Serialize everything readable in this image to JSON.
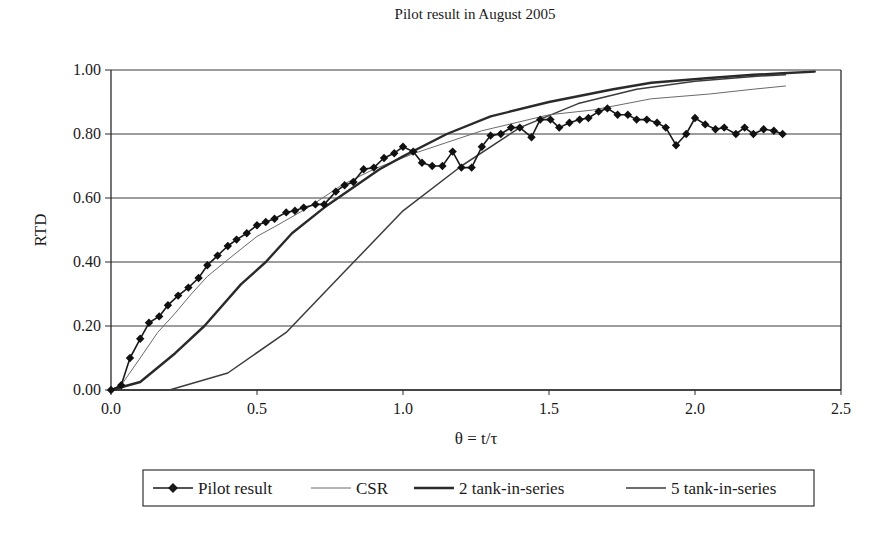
{
  "chart_data": {
    "type": "line",
    "title": "Pilot result in August 2005",
    "xlabel": "θ = t/τ",
    "ylabel": "RTD",
    "xlim": [
      0,
      2.5
    ],
    "ylim": [
      0,
      1.0
    ],
    "x_ticks": [
      "0.0",
      "0.5",
      "1.0",
      "1.5",
      "2.0",
      "2.5"
    ],
    "x_tick_values": [
      0,
      0.5,
      1.0,
      1.5,
      2.0,
      2.5
    ],
    "y_ticks": [
      "0.00",
      "0.20",
      "0.40",
      "0.60",
      "0.80",
      "1.00"
    ],
    "y_tick_values": [
      0,
      0.2,
      0.4,
      0.6,
      0.8,
      1.0
    ],
    "grid": {
      "horizontal": true,
      "vertical": false
    },
    "legend_position": "bottom",
    "series": [
      {
        "name": "Pilot result",
        "style": "line-with-diamond-markers",
        "color": "#1a1a1a",
        "points": [
          [
            0.0,
            0.0
          ],
          [
            0.035,
            0.015
          ],
          [
            0.065,
            0.1
          ],
          [
            0.1,
            0.16
          ],
          [
            0.13,
            0.21
          ],
          [
            0.165,
            0.23
          ],
          [
            0.195,
            0.265
          ],
          [
            0.23,
            0.295
          ],
          [
            0.265,
            0.32
          ],
          [
            0.3,
            0.35
          ],
          [
            0.33,
            0.39
          ],
          [
            0.365,
            0.42
          ],
          [
            0.4,
            0.45
          ],
          [
            0.43,
            0.47
          ],
          [
            0.465,
            0.49
          ],
          [
            0.5,
            0.515
          ],
          [
            0.53,
            0.525
          ],
          [
            0.56,
            0.535
          ],
          [
            0.6,
            0.555
          ],
          [
            0.63,
            0.56
          ],
          [
            0.66,
            0.57
          ],
          [
            0.7,
            0.58
          ],
          [
            0.73,
            0.58
          ],
          [
            0.77,
            0.62
          ],
          [
            0.8,
            0.64
          ],
          [
            0.83,
            0.65
          ],
          [
            0.865,
            0.69
          ],
          [
            0.9,
            0.695
          ],
          [
            0.935,
            0.725
          ],
          [
            0.97,
            0.74
          ],
          [
            1.0,
            0.76
          ],
          [
            1.035,
            0.745
          ],
          [
            1.065,
            0.71
          ],
          [
            1.1,
            0.7
          ],
          [
            1.135,
            0.7
          ],
          [
            1.17,
            0.745
          ],
          [
            1.2,
            0.695
          ],
          [
            1.235,
            0.695
          ],
          [
            1.27,
            0.76
          ],
          [
            1.3,
            0.795
          ],
          [
            1.335,
            0.8
          ],
          [
            1.37,
            0.82
          ],
          [
            1.4,
            0.82
          ],
          [
            1.44,
            0.79
          ],
          [
            1.47,
            0.845
          ],
          [
            1.505,
            0.845
          ],
          [
            1.535,
            0.82
          ],
          [
            1.57,
            0.835
          ],
          [
            1.605,
            0.845
          ],
          [
            1.635,
            0.85
          ],
          [
            1.67,
            0.87
          ],
          [
            1.7,
            0.88
          ],
          [
            1.735,
            0.86
          ],
          [
            1.77,
            0.86
          ],
          [
            1.8,
            0.845
          ],
          [
            1.835,
            0.845
          ],
          [
            1.87,
            0.835
          ],
          [
            1.9,
            0.82
          ],
          [
            1.935,
            0.765
          ],
          [
            1.97,
            0.8
          ],
          [
            2.0,
            0.85
          ],
          [
            2.035,
            0.83
          ],
          [
            2.07,
            0.815
          ],
          [
            2.1,
            0.82
          ],
          [
            2.14,
            0.8
          ],
          [
            2.17,
            0.82
          ],
          [
            2.2,
            0.8
          ],
          [
            2.235,
            0.815
          ],
          [
            2.27,
            0.81
          ],
          [
            2.3,
            0.8
          ]
        ]
      },
      {
        "name": "CSR",
        "style": "thin-line",
        "color": "#6a6a6a",
        "points": [
          [
            0.0,
            0.0
          ],
          [
            0.035,
            0.015
          ],
          [
            0.1,
            0.1
          ],
          [
            0.16,
            0.18
          ],
          [
            0.22,
            0.24
          ],
          [
            0.275,
            0.3
          ],
          [
            0.33,
            0.355
          ],
          [
            0.39,
            0.4
          ],
          [
            0.445,
            0.44
          ],
          [
            0.5,
            0.48
          ],
          [
            0.56,
            0.51
          ],
          [
            0.675,
            0.57
          ],
          [
            0.79,
            0.64
          ],
          [
            0.9,
            0.69
          ],
          [
            1.04,
            0.74
          ],
          [
            1.27,
            0.81
          ],
          [
            1.5,
            0.86
          ],
          [
            1.65,
            0.875
          ],
          [
            1.85,
            0.91
          ],
          [
            2.05,
            0.925
          ],
          [
            2.2,
            0.94
          ],
          [
            2.31,
            0.95
          ]
        ]
      },
      {
        "name": "2 tank-in-series",
        "style": "thick-line",
        "color": "#2a2a2a",
        "points": [
          [
            0.0,
            0.0
          ],
          [
            0.1,
            0.025
          ],
          [
            0.22,
            0.115
          ],
          [
            0.32,
            0.2
          ],
          [
            0.445,
            0.33
          ],
          [
            0.53,
            0.4
          ],
          [
            0.62,
            0.49
          ],
          [
            0.73,
            0.57
          ],
          [
            0.88,
            0.665
          ],
          [
            0.92,
            0.69
          ],
          [
            1.0,
            0.73
          ],
          [
            1.15,
            0.8
          ],
          [
            1.3,
            0.855
          ],
          [
            1.5,
            0.9
          ],
          [
            1.72,
            0.94
          ],
          [
            1.85,
            0.96
          ],
          [
            2.05,
            0.975
          ],
          [
            2.2,
            0.985
          ],
          [
            2.3,
            0.99
          ],
          [
            2.41,
            0.995
          ]
        ]
      },
      {
        "name": "5 tank-in-series",
        "style": "medium-line",
        "color": "#3c3c3c",
        "points": [
          [
            0.0,
            0.0
          ],
          [
            0.2,
            0.0
          ],
          [
            0.4,
            0.053
          ],
          [
            0.6,
            0.18
          ],
          [
            0.8,
            0.37
          ],
          [
            1.0,
            0.56
          ],
          [
            1.2,
            0.7
          ],
          [
            1.4,
            0.82
          ],
          [
            1.6,
            0.895
          ],
          [
            1.8,
            0.94
          ],
          [
            2.0,
            0.965
          ],
          [
            2.2,
            0.98
          ],
          [
            2.31,
            0.985
          ]
        ]
      }
    ]
  },
  "legend": {
    "items": [
      {
        "label": "Pilot result",
        "marker": "diamond"
      },
      {
        "label": "CSR",
        "marker": "none"
      },
      {
        "label": "2 tank-in-series",
        "marker": "none"
      },
      {
        "label": "5 tank-in-series",
        "marker": "none"
      }
    ]
  }
}
